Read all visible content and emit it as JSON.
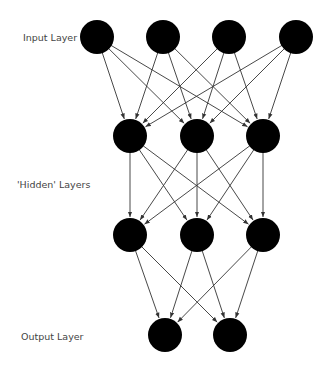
{
  "labels": {
    "input": "Input Layer",
    "hidden": "'Hidden' Layers",
    "output": "Output Layer"
  },
  "layers": [
    {
      "name": "input",
      "y": 37,
      "x": [
        97,
        163,
        229,
        296
      ]
    },
    {
      "name": "hidden1",
      "y": 136,
      "x": [
        130,
        197,
        263
      ]
    },
    {
      "name": "hidden2",
      "y": 235,
      "x": [
        130,
        197,
        263
      ]
    },
    {
      "name": "output",
      "y": 335,
      "x": [
        165,
        230
      ]
    }
  ],
  "node_radius": 17,
  "colors": {
    "node": "#000000",
    "edge": "#333333",
    "label": "#444444"
  }
}
